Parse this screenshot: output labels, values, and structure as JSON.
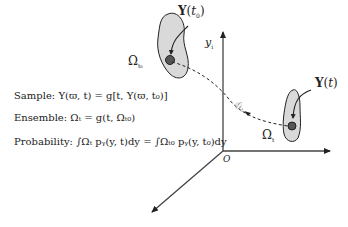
{
  "diagram": {
    "labels": {
      "y_initial": "Y(t₀)",
      "y_t": "Y(t)",
      "omega_t0": "Ω",
      "omega_t0_sub": "t₀",
      "omega_t": "Ω",
      "omega_t_sub": "t",
      "axis_y": "y",
      "axis_y_sub": "i",
      "origin": "O",
      "flow_map": "𝒵",
      "flow_map_sub": "t"
    },
    "equations": {
      "sample_label": "Sample:",
      "sample_expr": "Y(ϖ, t) = g[t, Y(ϖ, t₀)]",
      "ensemble_label": "Ensemble:",
      "ensemble_expr": "Ωₜ = g(t, Ωₜ₀)",
      "probability_label": "Probability:",
      "probability_expr": "∫Ωₜ pᵧ(y, t)dy = ∫Ωₜ₀ pᵧ(y, t₀)dy"
    },
    "colors": {
      "region_fill": "#d9d9d9",
      "stroke": "#222222",
      "axis": "#333333",
      "point": "#555555"
    }
  }
}
